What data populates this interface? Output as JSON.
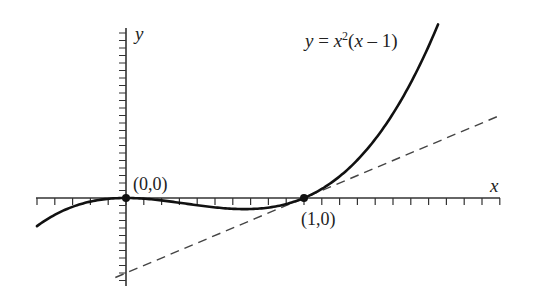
{
  "figure": {
    "equation_label": {
      "y": "y",
      "eq": " = ",
      "x": "x",
      "sup": "2",
      "paren_open": "(",
      "x2": "x",
      "rest": " – 1)"
    },
    "x_axis_label": "x",
    "y_axis_label": "y",
    "points": [
      {
        "label": "(0,0)",
        "x": 0,
        "y": 0
      },
      {
        "label": "(1,0)",
        "x": 1,
        "y": 0
      }
    ],
    "colors": {
      "curve": "#111111",
      "axis": "#333333",
      "tangent": "#444444",
      "point": "#111111"
    }
  },
  "chart_data": {
    "type": "line",
    "title": "",
    "xlabel": "x",
    "ylabel": "y",
    "xlim": [
      -0.5,
      2.1
    ],
    "ylim": [
      -1.15,
      2.3
    ],
    "grid": false,
    "tick_spacing": {
      "x": 0.1,
      "y": 0.1
    },
    "series": [
      {
        "name": "y = x^2(x - 1)",
        "style": "solid",
        "function": "x^2*(x-1)",
        "x_range": [
          -0.5,
          1.753
        ]
      },
      {
        "name": "tangent at (1,0): y = x - 1",
        "style": "dashed",
        "function": "x-1",
        "x_range": [
          -0.06,
          2.1
        ]
      }
    ],
    "annotations": [
      {
        "text": "y = x²(x − 1)",
        "near": "curve top"
      },
      {
        "text": "(0,0)",
        "point": [
          0,
          0
        ]
      },
      {
        "text": "(1,0)",
        "point": [
          1,
          0
        ]
      }
    ]
  }
}
